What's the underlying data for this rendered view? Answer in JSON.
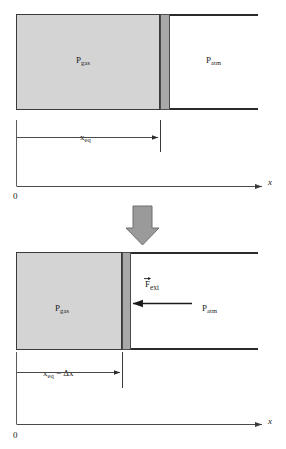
{
  "figure": {
    "colors": {
      "gas_fill": "#d4d4d4",
      "piston_fill": "#a8a8a8",
      "wall_stroke": "#2b2b2b",
      "arrow_block_fill": "#9a9a9a",
      "line_stroke": "#4a4a4a",
      "background": "#ffffff"
    }
  },
  "panel_equilibrium": {
    "name": "equilibrium-state",
    "gas_label": "P",
    "gas_label_sub": "gas",
    "atm_label": "P",
    "atm_label_sub": "atm",
    "dimension_label": "x",
    "dimension_label_sub": "eq",
    "axis_label": "x",
    "origin_label": "0",
    "gas_left_px": 16,
    "gas_right_px": 160,
    "piston_left_px": 160,
    "piston_right_px": 170,
    "wall_right_px": 258
  },
  "panel_compressed": {
    "name": "compressed-state",
    "gas_label": "P",
    "gas_label_sub": "gas",
    "atm_label": "P",
    "atm_label_sub": "atm",
    "force_label": "F",
    "force_label_sub": "ext",
    "dimension_label": "x",
    "dimension_label_sub": "eq",
    "dimension_label_tail": " − Δx",
    "axis_label": "x",
    "origin_label": "0",
    "gas_left_px": 16,
    "gas_right_px": 122,
    "piston_left_px": 122,
    "piston_right_px": 131,
    "wall_right_px": 258,
    "force_arrow_from_px": 192,
    "force_arrow_to_px": 131
  },
  "transition": {
    "name": "downward-transition-arrow",
    "direction": "down"
  }
}
